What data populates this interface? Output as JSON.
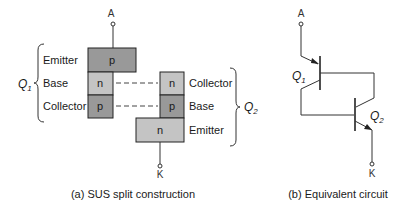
{
  "figure_a": {
    "caption": "(a)  SUS split construction",
    "terminal_top": "A",
    "terminal_bottom": "K",
    "q1": {
      "label": "Q",
      "sub": "1",
      "layers": [
        "Emitter",
        "Base",
        "Collector"
      ]
    },
    "q2": {
      "label": "Q",
      "sub": "2",
      "layers": [
        "Collector",
        "Base",
        "Emitter"
      ]
    },
    "regions": {
      "top_p": "p",
      "left_n": "n",
      "left_p": "p",
      "right_n": "n",
      "right_p": "p",
      "bottom_n": "n"
    }
  },
  "figure_b": {
    "caption": "(b)  Equivalent circuit",
    "terminal_top": "A",
    "terminal_bottom": "K",
    "q1": {
      "label": "Q",
      "sub": "1"
    },
    "q2": {
      "label": "Q",
      "sub": "2"
    }
  },
  "colors": {
    "dark_region": "#999999",
    "light_region": "#c4c4c4",
    "line": "#333333"
  }
}
